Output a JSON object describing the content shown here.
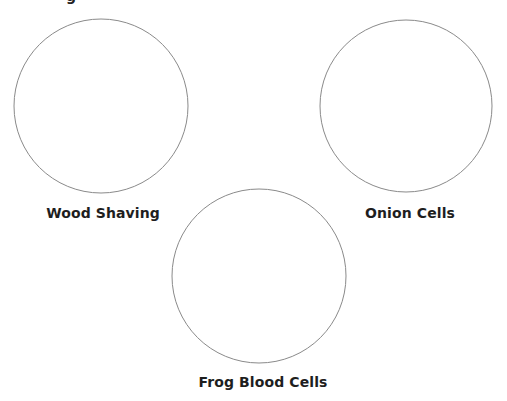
{
  "worksheet": {
    "top_fragment": "g",
    "stroke_color": "#8a8a8a",
    "specimens": [
      {
        "label": "Wood Shaving",
        "cx": 101,
        "cy": 106,
        "r": 87,
        "label_x": 103,
        "label_y": 205
      },
      {
        "label": "Onion Cells",
        "cx": 406,
        "cy": 106,
        "r": 86,
        "label_x": 410,
        "label_y": 205
      },
      {
        "label": "Frog Blood Cells",
        "cx": 259,
        "cy": 276,
        "r": 87,
        "label_x": 263,
        "label_y": 374
      }
    ]
  }
}
